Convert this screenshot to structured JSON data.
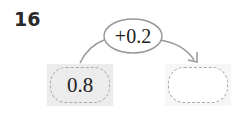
{
  "problem": {
    "number": "16"
  },
  "diagram": {
    "operation": "+0.2",
    "start_value": "0.8",
    "result_value": "",
    "colors": {
      "line": "#999999",
      "box_fill": "#ececec",
      "dash": "#aaaaaa"
    }
  }
}
